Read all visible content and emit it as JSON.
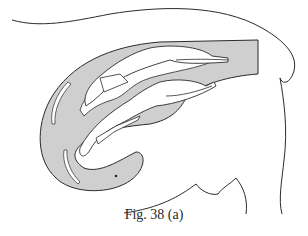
{
  "figure": {
    "caption": "Fig. 38 (a)",
    "colors": {
      "ink": "#2b2b2b",
      "shading": "#cfcfcf",
      "paper": "#ffffff"
    },
    "elements": [
      "body-outline",
      "uterus-horn-shaded",
      "fetus-upper",
      "fetus-lower",
      "umbilical-cords",
      "membrane-slits"
    ]
  }
}
